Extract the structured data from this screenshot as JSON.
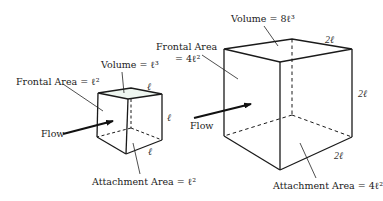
{
  "small_cube": {
    "volume_label": "Volume = ℓ³",
    "frontal_area_label": "Frontal Area = ℓ²",
    "attachment_area_label": "Attachment Area =  ℓ²",
    "flow_label": "Flow",
    "edge_top": "ℓ",
    "edge_side": "ℓ",
    "edge_bottom": "ℓ"
  },
  "large_cube": {
    "volume_label": "Volume = 8ℓ³",
    "frontal_area_label_line1": "Frontal Area",
    "frontal_area_label_line2": "= 4ℓ²",
    "attachment_area_label": "Attachment Area = 4ℓ²",
    "flow_label": "Flow",
    "edge_top": "2ℓ",
    "edge_side": "2ℓ",
    "edge_bottom": "2ℓ"
  },
  "colors": {
    "line": "#1a1a1a",
    "background": "#ffffff"
  }
}
